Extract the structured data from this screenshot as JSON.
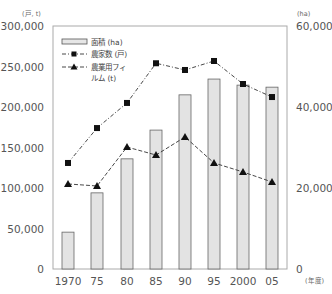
{
  "chart_data": {
    "type": "bar+line",
    "title": "",
    "categories": [
      "1970",
      "75",
      "80",
      "85",
      "90",
      "95",
      "2000",
      "05"
    ],
    "x_unit_label": "(年度)",
    "left_axis": {
      "unit_label": "(戸, t)",
      "ylim": [
        0,
        300000
      ],
      "ticks": [
        "0",
        "50,000",
        "100,000",
        "150,000",
        "200,000",
        "250,000",
        "300,000"
      ]
    },
    "right_axis": {
      "unit_label": "(ha)",
      "ylim": [
        0,
        60000
      ],
      "ticks": [
        "0",
        "20,000",
        "40,000",
        "60,000"
      ]
    },
    "series": [
      {
        "name": "面積 (ha)",
        "type": "bar",
        "axis": "right",
        "values": [
          9100,
          18800,
          27200,
          34300,
          43000,
          46900,
          45400,
          44900
        ]
      },
      {
        "name": "農家数 (戸)",
        "type": "line",
        "marker": "square",
        "axis": "left",
        "values": [
          130900,
          174000,
          205000,
          254000,
          245700,
          256800,
          228400,
          212300
        ]
      },
      {
        "name": "農業用フィルム (t)",
        "type": "line",
        "marker": "triangle",
        "axis": "left",
        "values": [
          105000,
          102500,
          150600,
          140700,
          163000,
          130900,
          119800,
          107400
        ]
      }
    ],
    "legend": {
      "position": "upper-left",
      "items": [
        "面積 (ha)",
        "農家数 (戸)",
        "農業用フィ ルム (t)"
      ]
    },
    "grid": false
  },
  "labels": {
    "left_unit": "(戸, t)",
    "right_unit": "(ha)",
    "x_unit": "(年度)",
    "legend_area": "面積 (ha)",
    "legend_households": "農家数 (戸)",
    "legend_film_1": "農業用フィ",
    "legend_film_2": "ルム (t)"
  }
}
